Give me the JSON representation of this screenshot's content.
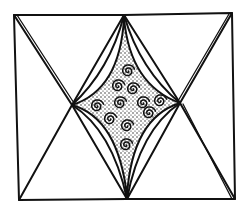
{
  "figure": {
    "title": "",
    "colors": {
      "ink": "#111111",
      "paper": "#ffffff"
    },
    "spiral_count": 11
  }
}
